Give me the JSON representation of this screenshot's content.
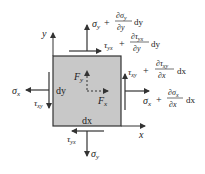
{
  "diagram": {
    "colors": {
      "element_fill": "#c8c8c8",
      "line": "#333333",
      "text": "#222222"
    },
    "axes": {
      "y_label": "y",
      "x_label": "x"
    },
    "element": {
      "height_label": "dy",
      "width_label": "dx"
    },
    "body_forces": {
      "fy_main": "F",
      "fy_sub": "y",
      "fx_main": "F",
      "fx_sub": "x"
    },
    "stresses": {
      "top_normal": {
        "main": "σ",
        "sub": "y",
        "plus": "+",
        "num": "∂σ",
        "num_sub": "y",
        "den": "∂y",
        "tail": "dy"
      },
      "top_shear": {
        "main": "τ",
        "sub": "yx",
        "plus": "+",
        "num": "∂τ",
        "num_sub": "yx",
        "den": "∂y",
        "tail": "dy"
      },
      "right_shear": {
        "main": "τ",
        "sub": "xy",
        "plus": "+",
        "num": "∂τ",
        "num_sub": "xy",
        "den": "∂x",
        "tail": "dx"
      },
      "right_normal": {
        "main": "σ",
        "sub": "x",
        "plus": "+",
        "num": "∂σ",
        "num_sub": "x",
        "den": "∂x",
        "tail": "dx"
      },
      "left_normal": {
        "main": "σ",
        "sub": "x"
      },
      "left_shear": {
        "main": "τ",
        "sub": "xy"
      },
      "bottom_shear": {
        "main": "τ",
        "sub": "yx"
      },
      "bottom_normal": {
        "main": "σ",
        "sub": "y"
      }
    }
  }
}
